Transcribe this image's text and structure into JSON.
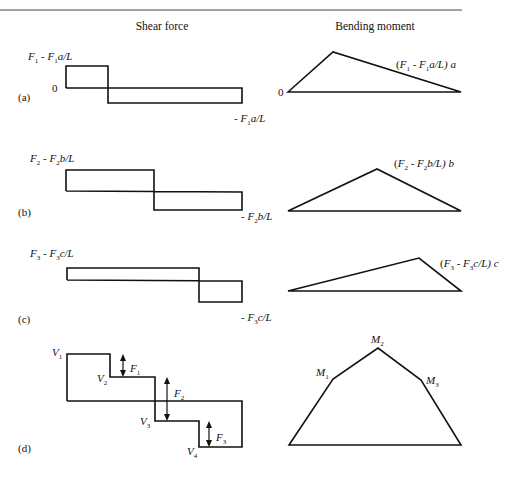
{
  "headers": {
    "shear": "Shear force",
    "moment": "Bending moment"
  },
  "panels": [
    {
      "id": "a",
      "tag": "(a)",
      "shear_top": {
        "F": "F",
        "s1": "1",
        "mid": " - ",
        "F2": "F",
        "s2": "1",
        "tail": "a/L"
      },
      "shear_zero": "0",
      "shear_bottom": {
        "pre": "- ",
        "F": "F",
        "s": "1",
        "tail": "a/L"
      },
      "moment_zero": "0",
      "moment_peak": {
        "open": "(",
        "F": "F",
        "s1": "1",
        "mid": " - ",
        "F2": "F",
        "s2": "1",
        "tail": "a/L) ",
        "var": "a"
      }
    },
    {
      "id": "b",
      "tag": "(b)",
      "shear_top": {
        "F": "F",
        "s1": "2",
        "mid": " - ",
        "F2": "F",
        "s2": "2",
        "tail": "b/L"
      },
      "shear_bottom": {
        "pre": "- ",
        "F": "F",
        "s": "2",
        "tail": "b/L"
      },
      "moment_peak": {
        "open": "(",
        "F": "F",
        "s1": "2",
        "mid": " - ",
        "F2": "F",
        "s2": "2",
        "tail": "b/L) ",
        "var": "b"
      }
    },
    {
      "id": "c",
      "tag": "(c)",
      "shear_top": {
        "F": "F",
        "s1": "3",
        "mid": " - ",
        "F2": "F",
        "s2": "3",
        "tail": "c/L"
      },
      "shear_bottom": {
        "pre": "- ",
        "F": "F",
        "s": "3",
        "tail": "c/L"
      },
      "moment_peak": {
        "open": "(",
        "F": "F",
        "s1": "3",
        "mid": " - ",
        "F2": "F",
        "s2": "3",
        "tail": "c/L) ",
        "var": "c"
      }
    },
    {
      "id": "d",
      "tag": "(d)",
      "shear_levels": [
        {
          "sym": "V",
          "sub": "1"
        },
        {
          "sym": "V",
          "sub": "2"
        },
        {
          "sym": "V",
          "sub": "3"
        },
        {
          "sym": "V",
          "sub": "4"
        }
      ],
      "forces": [
        {
          "sym": "F",
          "sub": "1"
        },
        {
          "sym": "F",
          "sub": "2"
        },
        {
          "sym": "F",
          "sub": "3"
        }
      ],
      "moments": [
        {
          "sym": "M",
          "sub": "1"
        },
        {
          "sym": "M",
          "sub": "2"
        },
        {
          "sym": "M",
          "sub": "3"
        }
      ]
    }
  ]
}
